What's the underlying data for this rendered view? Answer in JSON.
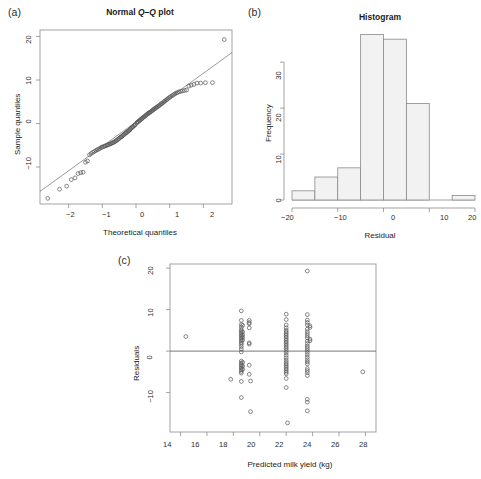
{
  "figure": {
    "panels": [
      {
        "key": "a",
        "label": "(a)"
      },
      {
        "key": "b",
        "label": "(b)"
      },
      {
        "key": "c",
        "label": "(c)"
      }
    ]
  },
  "chart_data": [
    {
      "panel": "a",
      "type": "scatter",
      "title": "Normal Q–Q plot",
      "title_prefix": "Normal ",
      "title_italic": "Q–Q",
      "title_suffix": " plot",
      "xlabel": "Theoretical quantiles",
      "ylabel": "Sample quantiles",
      "xlim": [
        -2.85,
        2.85
      ],
      "ylim": [
        -18.5,
        21.5
      ],
      "xticks": [
        -2,
        -1,
        0,
        1,
        2
      ],
      "xticklabels": [
        "−2",
        "−1",
        "0",
        "1",
        "2"
      ],
      "yticks": [
        -10,
        0,
        10,
        20
      ],
      "yticklabels": [
        "−10",
        "0",
        "10",
        "20"
      ],
      "grid": false,
      "legend": "none",
      "reference_line": {
        "slope": 5.6,
        "intercept": 0.35,
        "description": "qqline through quartiles"
      },
      "x": [
        -2.62,
        -2.27,
        -2.06,
        -1.92,
        -1.81,
        -1.72,
        -1.64,
        -1.57,
        -1.5,
        -1.44,
        -1.38,
        -1.33,
        -1.28,
        -1.23,
        -1.19,
        -1.15,
        -1.11,
        -1.07,
        -1.03,
        -1.0,
        -0.96,
        -0.93,
        -0.9,
        -0.86,
        -0.83,
        -0.8,
        -0.77,
        -0.74,
        -0.71,
        -0.69,
        -0.66,
        -0.63,
        -0.6,
        -0.58,
        -0.55,
        -0.52,
        -0.5,
        -0.47,
        -0.45,
        -0.42,
        -0.4,
        -0.37,
        -0.35,
        -0.32,
        -0.3,
        -0.28,
        -0.25,
        -0.23,
        -0.2,
        -0.18,
        -0.16,
        -0.13,
        -0.11,
        -0.09,
        -0.06,
        -0.04,
        -0.02,
        0.02,
        0.04,
        0.06,
        0.09,
        0.11,
        0.13,
        0.16,
        0.18,
        0.2,
        0.23,
        0.25,
        0.28,
        0.3,
        0.32,
        0.35,
        0.37,
        0.4,
        0.42,
        0.45,
        0.47,
        0.5,
        0.52,
        0.55,
        0.58,
        0.6,
        0.63,
        0.66,
        0.69,
        0.71,
        0.74,
        0.77,
        0.8,
        0.83,
        0.86,
        0.9,
        0.93,
        0.96,
        1.0,
        1.03,
        1.07,
        1.11,
        1.15,
        1.19,
        1.23,
        1.28,
        1.33,
        1.38,
        1.44,
        1.5,
        1.57,
        1.64,
        1.72,
        1.81,
        1.92,
        2.06,
        2.27,
        2.62
      ],
      "y": [
        -17.2,
        -15.1,
        -14.4,
        -12.9,
        -12.5,
        -11.5,
        -11.3,
        -11.2,
        -8.9,
        -8.6,
        -7.2,
        -6.9,
        -6.6,
        -6.4,
        -6.2,
        -6.0,
        -5.9,
        -5.7,
        -5.5,
        -5.4,
        -5.3,
        -5.2,
        -5.1,
        -5.0,
        -4.9,
        -4.8,
        -4.7,
        -4.6,
        -4.5,
        -4.4,
        -4.3,
        -4.2,
        -4.0,
        -3.9,
        -3.7,
        -3.6,
        -3.4,
        -3.2,
        -3.1,
        -3.0,
        -2.8,
        -2.6,
        -2.5,
        -2.3,
        -2.2,
        -2.0,
        -1.9,
        -1.7,
        -1.6,
        -1.4,
        -1.2,
        -1.0,
        -0.9,
        -0.7,
        -0.5,
        -0.4,
        -0.2,
        0.1,
        0.3,
        0.4,
        0.6,
        0.7,
        0.9,
        1.0,
        1.2,
        1.3,
        1.5,
        1.6,
        1.8,
        1.9,
        2.1,
        2.2,
        2.4,
        2.5,
        2.6,
        2.8,
        2.9,
        3.1,
        3.2,
        3.4,
        3.5,
        3.7,
        3.8,
        4.0,
        4.1,
        4.3,
        4.5,
        4.6,
        4.8,
        5.0,
        5.2,
        5.4,
        5.6,
        5.8,
        6.0,
        6.2,
        6.4,
        6.6,
        6.8,
        7.0,
        7.1,
        7.3,
        7.4,
        7.5,
        7.6,
        7.7,
        8.6,
        8.8,
        9.0,
        9.3,
        9.3,
        9.4,
        9.4,
        19.3
      ]
    },
    {
      "panel": "b",
      "type": "bar",
      "title": "Histogram",
      "xlabel": "Residual",
      "ylabel": "Frequency",
      "xlim": [
        -20,
        20
      ],
      "ylim": [
        0,
        37
      ],
      "xticks": [
        -20,
        -10,
        0,
        10,
        20
      ],
      "xticklabels": [
        "−20",
        "−10",
        "0",
        "10",
        "20"
      ],
      "yticks": [
        0,
        10,
        20,
        30
      ],
      "yticklabels": [
        "0",
        "10",
        "20",
        "30"
      ],
      "grid": false,
      "legend": "none",
      "bin_width": 5,
      "bin_edges": [
        -20,
        -15,
        -10,
        -5,
        0,
        5,
        10,
        15,
        20
      ],
      "categories": [
        "[-20,-15)",
        "[-15,-10)",
        "[-10,-5)",
        "[-5,0)",
        "[0,5)",
        "[5,10)",
        "[10,15)",
        "[15,20]"
      ],
      "values": [
        2,
        5,
        7,
        36,
        35,
        21,
        0,
        1
      ]
    },
    {
      "panel": "c",
      "type": "scatter",
      "title": "",
      "xlabel": "Predicted milk yield (kg)",
      "ylabel": "Residuals",
      "xlim": [
        13.2,
        28.8
      ],
      "ylim": [
        -19.5,
        21.0
      ],
      "xticks": [
        14,
        16,
        18,
        20,
        22,
        24,
        26,
        28
      ],
      "xticklabels": [
        "14",
        "16",
        "18",
        "20",
        "22",
        "24",
        "26",
        "28"
      ],
      "yticks": [
        -10,
        0,
        10,
        20
      ],
      "yticklabels": [
        "−10",
        "0",
        "10",
        "20"
      ],
      "grid": false,
      "legend": "none",
      "zero_line": 0,
      "points": [
        [
          14.4,
          3.5
        ],
        [
          17.8,
          -6.8
        ],
        [
          18.6,
          9.7
        ],
        [
          18.6,
          7.4
        ],
        [
          18.6,
          6.4
        ],
        [
          18.6,
          5.8
        ],
        [
          18.6,
          5.2
        ],
        [
          18.6,
          4.8
        ],
        [
          18.6,
          4.4
        ],
        [
          18.6,
          4.0
        ],
        [
          18.6,
          3.6
        ],
        [
          18.6,
          3.2
        ],
        [
          18.6,
          2.8
        ],
        [
          18.6,
          2.4
        ],
        [
          18.6,
          2.0
        ],
        [
          18.6,
          1.6
        ],
        [
          18.6,
          1.1
        ],
        [
          18.6,
          0.5
        ],
        [
          18.6,
          -0.2
        ],
        [
          18.6,
          -2.4
        ],
        [
          18.6,
          -2.9
        ],
        [
          18.6,
          -3.3
        ],
        [
          18.6,
          -3.7
        ],
        [
          18.6,
          -4.1
        ],
        [
          18.6,
          -4.5
        ],
        [
          18.6,
          -4.9
        ],
        [
          18.6,
          -5.3
        ],
        [
          18.6,
          -7.3
        ],
        [
          18.6,
          -11.2
        ],
        [
          18.7,
          6.2
        ],
        [
          18.7,
          4.6
        ],
        [
          18.7,
          3.9
        ],
        [
          18.7,
          3.3
        ],
        [
          18.7,
          2.7
        ],
        [
          18.7,
          -2.7
        ],
        [
          18.7,
          -3.6
        ],
        [
          18.7,
          -4.4
        ],
        [
          19.2,
          7.4
        ],
        [
          19.2,
          6.6
        ],
        [
          19.2,
          6.9
        ],
        [
          19.2,
          5.6
        ],
        [
          19.2,
          2.0
        ],
        [
          19.2,
          1.7
        ],
        [
          19.2,
          -3.4
        ],
        [
          19.2,
          -5.6
        ],
        [
          19.3,
          -7.2
        ],
        [
          19.3,
          -14.6
        ],
        [
          22.0,
          8.9
        ],
        [
          22.0,
          7.6
        ],
        [
          22.0,
          6.3
        ],
        [
          22.0,
          5.6
        ],
        [
          22.0,
          5.0
        ],
        [
          22.0,
          4.6
        ],
        [
          22.0,
          4.2
        ],
        [
          22.0,
          3.8
        ],
        [
          22.0,
          3.4
        ],
        [
          22.0,
          3.0
        ],
        [
          22.0,
          2.6
        ],
        [
          22.0,
          2.2
        ],
        [
          22.0,
          1.8
        ],
        [
          22.0,
          1.4
        ],
        [
          22.0,
          1.0
        ],
        [
          22.0,
          0.6
        ],
        [
          22.0,
          0.1
        ],
        [
          22.0,
          -0.4
        ],
        [
          22.0,
          -1.0
        ],
        [
          22.0,
          -1.6
        ],
        [
          22.0,
          -2.2
        ],
        [
          22.0,
          -2.7
        ],
        [
          22.0,
          -3.1
        ],
        [
          22.0,
          -3.5
        ],
        [
          22.0,
          -3.9
        ],
        [
          22.0,
          -4.3
        ],
        [
          22.0,
          -4.7
        ],
        [
          22.0,
          -5.1
        ],
        [
          22.0,
          -5.5
        ],
        [
          22.0,
          -6.6
        ],
        [
          22.0,
          -8.8
        ],
        [
          22.1,
          -17.3
        ],
        [
          23.6,
          19.3
        ],
        [
          23.6,
          8.8
        ],
        [
          23.6,
          7.5
        ],
        [
          23.6,
          6.9
        ],
        [
          23.6,
          6.3
        ],
        [
          23.6,
          5.3
        ],
        [
          23.6,
          4.7
        ],
        [
          23.6,
          4.2
        ],
        [
          23.6,
          3.7
        ],
        [
          23.6,
          3.2
        ],
        [
          23.6,
          2.4
        ],
        [
          23.6,
          1.8
        ],
        [
          23.6,
          1.2
        ],
        [
          23.6,
          0.7
        ],
        [
          23.6,
          0.2
        ],
        [
          23.6,
          -0.3
        ],
        [
          23.6,
          -0.9
        ],
        [
          23.6,
          -1.5
        ],
        [
          23.6,
          -2.1
        ],
        [
          23.6,
          -2.6
        ],
        [
          23.6,
          -3.1
        ],
        [
          23.6,
          -4.2
        ],
        [
          23.6,
          -4.7
        ],
        [
          23.6,
          -5.2
        ],
        [
          23.6,
          -5.9
        ],
        [
          23.6,
          -11.6
        ],
        [
          23.6,
          -12.3
        ],
        [
          23.6,
          -14.4
        ],
        [
          23.8,
          6.1
        ],
        [
          23.8,
          5.7
        ],
        [
          23.8,
          2.9
        ],
        [
          23.8,
          2.5
        ],
        [
          27.8,
          -5.0
        ]
      ]
    }
  ]
}
